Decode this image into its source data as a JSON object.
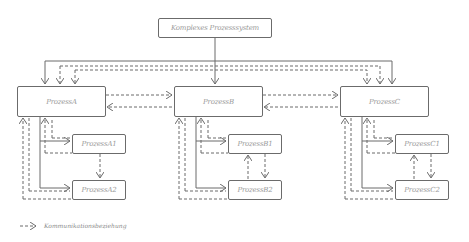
{
  "diagram": {
    "root": {
      "label": "Komplexes Prozesssystem"
    },
    "processes": [
      {
        "id": "A",
        "label": "ProzessA",
        "children": [
          {
            "id": "A1",
            "label": "ProzessA1"
          },
          {
            "id": "A2",
            "label": "ProzessA2"
          }
        ]
      },
      {
        "id": "B",
        "label": "ProzessB",
        "children": [
          {
            "id": "B1",
            "label": "ProzessB1"
          },
          {
            "id": "B2",
            "label": "ProzessB2"
          }
        ]
      },
      {
        "id": "C",
        "label": "ProzessC",
        "children": [
          {
            "id": "C1",
            "label": "ProzessC1"
          },
          {
            "id": "C2",
            "label": "ProzessC2"
          }
        ]
      }
    ],
    "legend": {
      "symbol": "dashed-arrow",
      "label": "Kommunikationsbeziehung"
    },
    "colors": {
      "stroke": "#6b6b6b",
      "text": "#9a9a9a",
      "background": "#ffffff"
    }
  }
}
